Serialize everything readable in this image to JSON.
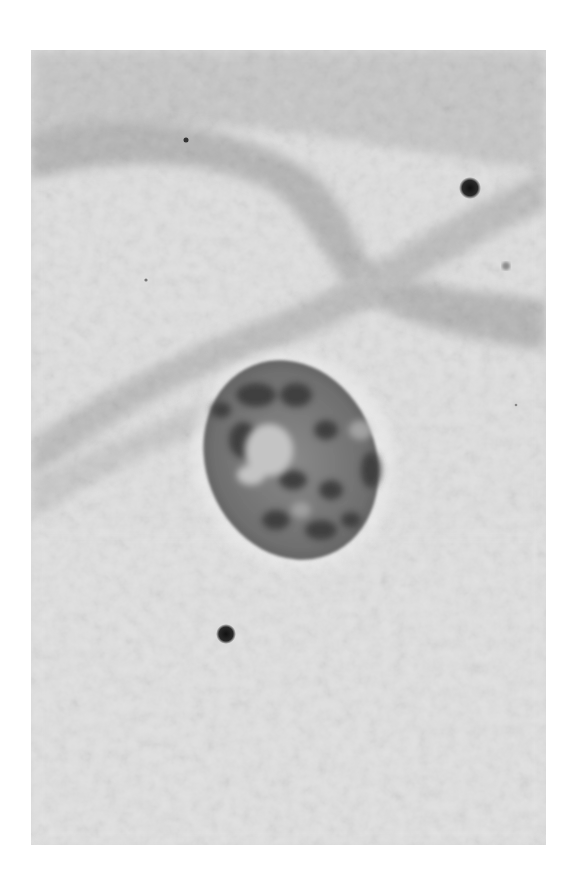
{
  "image": {
    "kind": "grayscale micrograph",
    "subject": "single cell nucleus with surrounding cell membrane folds",
    "colors": {
      "page_background": "#ffffff",
      "field_background": "#dcdcdc",
      "membrane_band": "#b9b9b9",
      "nucleus_fill": "#7a7a7a",
      "nucleus_dark_chromatin": "#3a3a3a",
      "nucleolus_light": "#c4c4c4",
      "particle": "#1e1e1e"
    },
    "features": [
      {
        "name": "nucleus",
        "shape": "oval",
        "center": [
          291,
          460
        ],
        "rx": 88,
        "ry": 100
      },
      {
        "name": "particle",
        "center": [
          470,
          188
        ],
        "r": 9
      },
      {
        "name": "particle",
        "center": [
          226,
          634
        ],
        "r": 8
      },
      {
        "name": "particle",
        "center": [
          186,
          140
        ],
        "r": 2
      },
      {
        "name": "particle",
        "center": [
          506,
          266
        ],
        "r": 3
      }
    ]
  }
}
